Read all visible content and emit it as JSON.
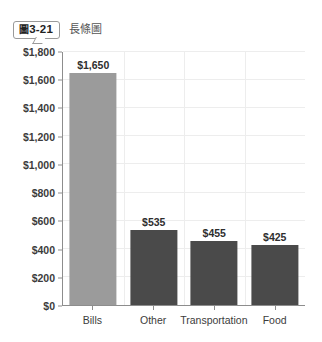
{
  "figure": {
    "badge_cjk": "圖",
    "badge_number": "3-21",
    "caption": "長條圖"
  },
  "chart_data": {
    "type": "bar",
    "title": "",
    "xlabel": "",
    "ylabel": "",
    "categories": [
      "Bills",
      "Other",
      "Transportation",
      "Food"
    ],
    "values": [
      1650,
      535,
      455,
      425
    ],
    "value_labels": [
      "$1,650",
      "$535",
      "$455",
      "$425"
    ],
    "bar_colors": [
      "#9b9b9b",
      "#4a4a4a",
      "#4a4a4a",
      "#4a4a4a"
    ],
    "ylim": [
      0,
      1800
    ],
    "ytick_values": [
      0,
      200,
      400,
      600,
      800,
      1000,
      1200,
      1400,
      1600,
      1800
    ],
    "ytick_labels": [
      "$0",
      "$200",
      "$400",
      "$600",
      "$800",
      "$1,000",
      "$1,200",
      "$1,400",
      "$1,600",
      "$1,800"
    ],
    "grid": {
      "horizontal": true,
      "vertical": true,
      "color": "#ededed"
    },
    "legend": null,
    "axis_color": "#8d8d8d"
  }
}
